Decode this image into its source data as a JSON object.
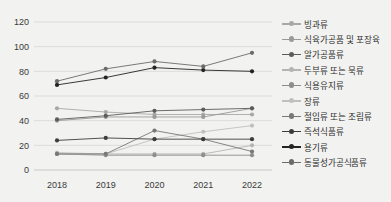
{
  "chart_data": {
    "type": "line",
    "title": "",
    "xlabel": "",
    "ylabel": "",
    "categories": [
      "2018",
      "2019",
      "2020",
      "2021",
      "2022"
    ],
    "x": [
      2018,
      2019,
      2020,
      2021,
      2022
    ],
    "ylim": [
      0,
      120
    ],
    "yticks": [
      0,
      20,
      40,
      60,
      80,
      100,
      120
    ],
    "grid": true,
    "legend_position": "right",
    "series": [
      {
        "name": "빙과류",
        "values": [
          50,
          47,
          45,
          45,
          45
        ],
        "color": "#a8a8a8"
      },
      {
        "name": "식육가공품 및 포장육",
        "values": [
          40,
          43,
          43,
          43,
          50
        ],
        "color": "#9a9a9a"
      },
      {
        "name": "알가공품류",
        "values": [
          41,
          44,
          48,
          49,
          50
        ],
        "color": "#5c5c5c"
      },
      {
        "name": "두부류 또는 묵류",
        "values": [
          14,
          13,
          13,
          13,
          20
        ],
        "color": "#b4b4b4"
      },
      {
        "name": "식용유지류",
        "values": [
          13,
          12,
          12,
          12,
          12
        ],
        "color": "#8d8d8d"
      },
      {
        "name": "장류",
        "values": [
          13,
          13,
          25,
          31,
          36
        ],
        "color": "#c0c0c0"
      },
      {
        "name": "절임류 또는 조림류",
        "values": [
          13,
          13,
          32,
          25,
          15
        ],
        "color": "#787878"
      },
      {
        "name": "즉석식품류",
        "values": [
          24,
          26,
          25,
          25,
          25
        ],
        "color": "#3d3d3d"
      },
      {
        "name": "용기류",
        "values": [
          69,
          75,
          83,
          81,
          80
        ],
        "color": "#242424"
      },
      {
        "name": "동물성가공식품류",
        "values": [
          72,
          82,
          88,
          84,
          95
        ],
        "color": "#6b6b6b"
      }
    ]
  },
  "legend": {
    "items": [
      {
        "label": "빙과류"
      },
      {
        "label": "식육가공품 및 포장육"
      },
      {
        "label": "알가공품류"
      },
      {
        "label": "두부류 또는 묵류"
      },
      {
        "label": "식용유지류"
      },
      {
        "label": "장류"
      },
      {
        "label": "절임류 또는 조림류"
      },
      {
        "label": "즉석식품류"
      },
      {
        "label": "용기류"
      },
      {
        "label": "동물성가공식품류"
      }
    ]
  },
  "colors": {
    "background": "#f2f2f0",
    "grid": "#dcdcda",
    "text": "#3a3a3a"
  }
}
